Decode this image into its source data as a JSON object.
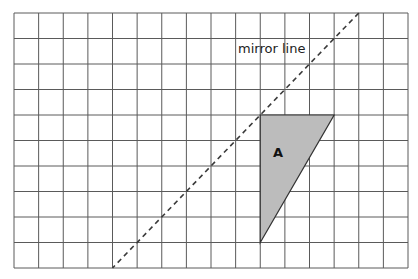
{
  "grid": {
    "columns": 16,
    "rows": 10,
    "origin_px": [
      14,
      13
    ],
    "cell_width_px": 24.625,
    "cell_height_px": 25.5,
    "line_color": "#5a5a5a"
  },
  "shape_a": {
    "label": "A",
    "vertices_grid": [
      [
        10,
        4
      ],
      [
        13,
        4
      ],
      [
        10,
        9
      ]
    ],
    "label_grid": [
      10.52,
      5.65
    ],
    "fill": "#bcbcbc",
    "stroke": "#333333"
  },
  "mirror_line": {
    "label": "mirror line",
    "start_grid": [
      14,
      0
    ],
    "end_grid": [
      4,
      10
    ],
    "label_grid": [
      9.1,
      1.55
    ],
    "style": "dashed",
    "color": "#3a3a3a"
  }
}
